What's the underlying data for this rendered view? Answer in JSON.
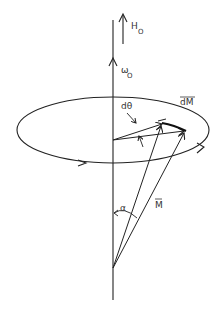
{
  "diagram": {
    "type": "precession-of-magnetization",
    "colors": {
      "stroke": "#222222",
      "background": "#ffffff"
    },
    "labels": {
      "field": "H",
      "field_sub": "O",
      "frequency": "ω",
      "frequency_sub": "O",
      "angle_step": "dθ",
      "delta_m": "dM",
      "magnetization": "M",
      "tilt_angle": "α"
    },
    "elements": [
      {
        "name": "main-axis",
        "kind": "line"
      },
      {
        "name": "field-arrow",
        "kind": "arrow",
        "label": "H_O"
      },
      {
        "name": "angular-velocity-arrow",
        "kind": "arrow",
        "label": "ω_O"
      },
      {
        "name": "precession-orbit",
        "kind": "ellipse",
        "direction": "counterclockwise (viewed from top)"
      },
      {
        "name": "magnetization-vector",
        "kind": "arrow",
        "label": "M"
      },
      {
        "name": "delta-m-vector",
        "kind": "arrow",
        "label": "dM"
      },
      {
        "name": "angle-arc",
        "kind": "arc",
        "label": "α"
      },
      {
        "name": "dtheta-arc",
        "kind": "arc",
        "label": "dθ"
      }
    ]
  }
}
